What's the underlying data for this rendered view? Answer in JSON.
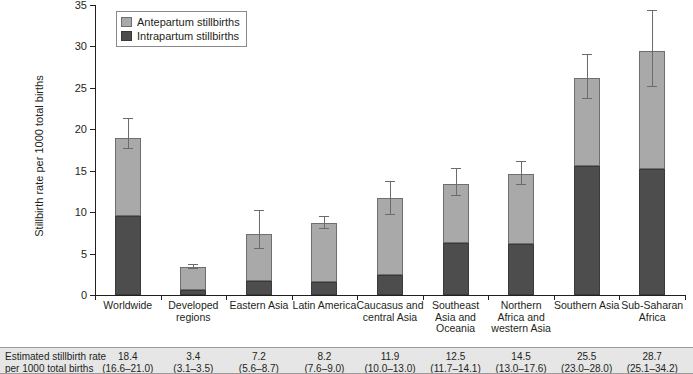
{
  "chart_data": {
    "type": "bar",
    "subtype": "stacked-bar-with-error-bars",
    "title": "",
    "xlabel": "",
    "ylabel": "Stillbirth rate per 1000 total births",
    "ylim": [
      0,
      35
    ],
    "ytick_step": 5,
    "yticks": [
      0,
      5,
      10,
      15,
      20,
      25,
      30,
      35
    ],
    "grid": false,
    "legend_position": "top-left-inside",
    "categories": [
      "Worldwide",
      "Developed regions",
      "Eastern Asia",
      "Latin America",
      "Caucasus and central Asia",
      "Southeast Asia and Oceania",
      "Northern Africa and western Asia",
      "Southern Asia",
      "Sub-Saharan Africa"
    ],
    "series": [
      {
        "name": "Intrapartum stillbirths",
        "color": "#4d4d4d",
        "values": [
          9.5,
          0.6,
          1.7,
          1.6,
          2.4,
          6.3,
          6.2,
          15.6,
          15.2
        ]
      },
      {
        "name": "Antepartum stillbirths",
        "color": "#a9a9a9",
        "values": [
          9.5,
          2.8,
          5.7,
          7.1,
          9.3,
          7.1,
          8.4,
          10.6,
          14.2
        ]
      }
    ],
    "totals": [
      19.0,
      3.4,
      7.4,
      8.7,
      11.7,
      13.4,
      14.6,
      26.2,
      29.4
    ],
    "error_bars": {
      "lower": [
        17.6,
        3.1,
        5.5,
        8.0,
        9.6,
        12.0,
        13.3,
        23.6,
        25.1
      ],
      "upper": [
        21.2,
        3.6,
        10.2,
        9.4,
        13.7,
        15.2,
        16.1,
        29.0,
        34.3
      ]
    }
  },
  "legend": {
    "items": [
      {
        "label": "Antepartum stillbirths",
        "color": "#a9a9a9"
      },
      {
        "label": "Intrapartum stillbirths",
        "color": "#4d4d4d"
      }
    ]
  },
  "axis": {
    "y_title": "Stillbirth rate per 1000 total births",
    "y_tick_labels": [
      "0",
      "5",
      "10",
      "15",
      "20",
      "25",
      "30",
      "35"
    ]
  },
  "category_labels": [
    [
      "Worldwide"
    ],
    [
      "Developed",
      "regions"
    ],
    [
      "Eastern Asia"
    ],
    [
      "Latin America"
    ],
    [
      "Caucasus and",
      "central Asia"
    ],
    [
      "Southeast",
      "Asia and",
      "Oceania"
    ],
    [
      "Northern",
      "Africa and",
      "western Asia"
    ],
    [
      "Southern Asia"
    ],
    [
      "Sub-Saharan",
      "Africa"
    ]
  ],
  "table": {
    "row_label": "Estimated stillbirth rate per 1000 total births",
    "row_label_line1": "Estimated stillbirth rate",
    "row_label_line2": "per 1000 total births",
    "values": [
      "18.4",
      "3.4",
      "7.2",
      "8.2",
      "11.9",
      "12.5",
      "14.5",
      "25.5",
      "28.7"
    ],
    "confidence_intervals": [
      "(16.6–21.0)",
      "(3.1–3.5)",
      "(5.6–8.7)",
      "(7.6–9.0)",
      "(10.0–13.0)",
      "(11.7–14.1)",
      "(13.0–17.6)",
      "(23.0–28.0)",
      "(25.1–34.2)"
    ]
  }
}
